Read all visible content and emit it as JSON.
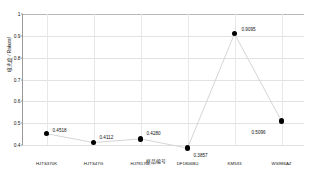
{
  "chart_data": {
    "type": "line",
    "title": "",
    "xlabel": "样品编号",
    "ylabel": "吸光度 / Rakuraf",
    "categories": [
      "HJTS370K",
      "HJTS47G",
      "HJ78170L",
      "DF1806BU",
      "KM533",
      "WS986AZ"
    ],
    "values": [
      0.4518,
      0.4112,
      0.428,
      0.3857,
      0.9095,
      0.5096
    ],
    "point_labels": [
      "0.4518",
      "0.4112",
      "0.4280",
      "0.3857",
      "0.9095",
      "0.5096"
    ],
    "ylim": [
      0.4,
      1.0
    ],
    "y_ticks": [
      "0.4",
      "0.5",
      "0.6",
      "0.7",
      "0.8",
      "0.9",
      "1"
    ],
    "y_tick_values": [
      0.4,
      0.5,
      0.6,
      0.7,
      0.8,
      0.9,
      1.0
    ],
    "grid": true,
    "legend": "none",
    "series": [
      {
        "name": "",
        "values": [
          0.4518,
          0.4112,
          0.428,
          0.3857,
          0.9095,
          0.5096
        ],
        "line_color": "#d0d0d0",
        "marker_color": "#000000"
      }
    ]
  },
  "colors": {
    "background": "#ffffff",
    "axis": "#9a9a9a",
    "gridline": "#e2e2e2",
    "line": "#d0d0d0",
    "marker": "#000000",
    "text": "#111111"
  }
}
